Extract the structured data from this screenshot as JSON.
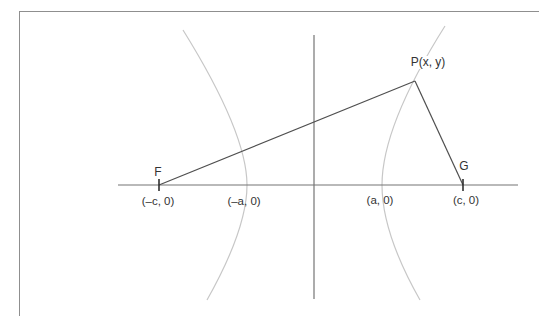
{
  "diagram": {
    "labels": {
      "point_p": "P(x, y)",
      "focus_left": "F",
      "focus_right": "G",
      "coord_focus_left": "(–c, 0)",
      "coord_vertex_left": "(–a, 0)",
      "coord_vertex_right": "(a, 0)",
      "coord_focus_right": "(c, 0)"
    },
    "colors": {
      "page-bg": "#ffffff",
      "border-color": "#8f8f8f",
      "axis-color": "#757575",
      "segment-color": "#4f4f4f",
      "curve-color": "#c7c7c7",
      "tick-color": "#2f2f2f",
      "text-color": "#333333"
    }
  }
}
